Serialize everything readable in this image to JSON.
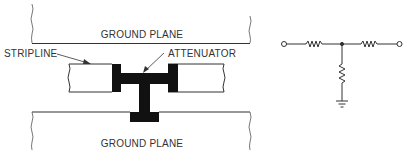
{
  "diagram": {
    "physical_layout": {
      "top_ground_plane_label": "GROUND PLANE",
      "bottom_ground_plane_label": "GROUND PLANE",
      "stripline_label": "STRIPLINE",
      "attenuator_label": "ATTENUATOR"
    },
    "schematic": {
      "type": "T-network attenuator",
      "components": [
        "input-terminal",
        "series-resistor-left",
        "junction-node",
        "series-resistor-right",
        "output-terminal",
        "shunt-resistor",
        "ground-symbol"
      ]
    },
    "colors": {
      "line": "#333333",
      "fill_dark": "#111111",
      "background": "#ffffff"
    }
  }
}
